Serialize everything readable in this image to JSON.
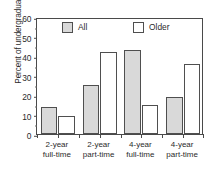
{
  "chart_data": {
    "type": "bar",
    "title": "",
    "xlabel": "",
    "ylabel": "Percent of undergraduates",
    "ylim": [
      0,
      60
    ],
    "ytick_labels": [
      "0",
      "10",
      "20",
      "30",
      "40",
      "50",
      "60"
    ],
    "ytick_values": [
      0,
      10,
      20,
      30,
      40,
      50,
      60
    ],
    "grid": false,
    "legend_position": "top-inside",
    "categories": [
      "2-year full-time",
      "2-year part-time",
      "4-year full-time",
      "4-year part-time"
    ],
    "category_lines": [
      [
        "2-year",
        "full-time"
      ],
      [
        "2-year",
        "part-time"
      ],
      [
        "4-year",
        "full-time"
      ],
      [
        "4-year",
        "part-time"
      ]
    ],
    "series": [
      {
        "name": "All",
        "color": "#d9d9d9",
        "values": [
          14,
          25,
          43,
          19
        ]
      },
      {
        "name": "Older",
        "color": "#ffffff",
        "values": [
          9,
          42,
          15,
          36
        ]
      }
    ]
  },
  "legend": {
    "items": [
      {
        "label": "All",
        "style": "all"
      },
      {
        "label": "Older",
        "style": "older"
      }
    ]
  },
  "colors": {
    "bar_all_fill": "#d9d9d9",
    "bar_older_fill": "#ffffff",
    "outline": "#4f4f4f",
    "axis": "#4a4a4a",
    "text": "#2b2b2b",
    "background": "#ffffff"
  }
}
